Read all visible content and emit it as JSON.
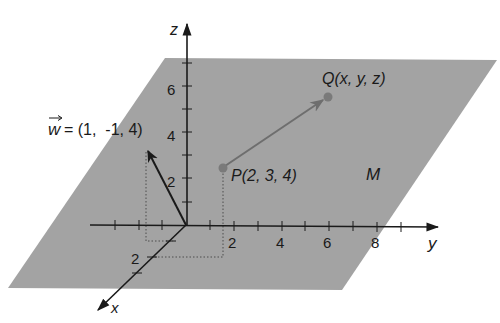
{
  "diagram": {
    "plane": {
      "name": "M",
      "fill": "#a3a3a3",
      "points": [
        [
          165,
          58
        ],
        [
          497,
          60
        ],
        [
          342,
          290
        ],
        [
          8,
          288
        ]
      ]
    },
    "axes": {
      "origin": [
        186,
        225
      ],
      "z": {
        "label": "z",
        "end": [
          187,
          22
        ],
        "ticks": [
          "2",
          "4",
          "6"
        ]
      },
      "y": {
        "label": "y",
        "end": [
          440,
          227
        ],
        "ticks": [
          "2",
          "4",
          "6",
          "8"
        ]
      },
      "x": {
        "label": "x",
        "end": [
          97,
          310
        ],
        "ticks": [
          "2"
        ]
      }
    },
    "vector_w": {
      "label_name": "w",
      "label_value": "= (1,  -1, 4)",
      "start": [
        186,
        225
      ],
      "end": [
        148,
        150
      ]
    },
    "point_P": {
      "label": "P(2, 3, 4)",
      "pos": [
        223,
        168
      ]
    },
    "point_Q": {
      "label": "Q(x, y, z)",
      "pos": [
        328,
        97
      ]
    },
    "colors": {
      "plane": "#a3a3a3",
      "axis": "#1a1a1a",
      "arrow_PQ": "#6e6e6e",
      "point": "#7a7a7a"
    }
  }
}
